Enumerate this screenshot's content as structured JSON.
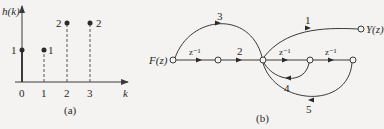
{
  "figure_a": {
    "y_label": "h(k)",
    "x_label": "k",
    "caption": "(a)",
    "ticks": [
      "0",
      "1",
      "2",
      "3"
    ],
    "points": [
      {
        "k": "0",
        "value": "1",
        "label_side": "left"
      },
      {
        "k": "1",
        "value": "1",
        "label_side": "right"
      },
      {
        "k": "2",
        "value": "2",
        "label_side": "left"
      },
      {
        "k": "3",
        "value": "2",
        "label_side": "right"
      }
    ]
  },
  "figure_b": {
    "caption": "(b)",
    "input": "F(z)",
    "output": "Y(z)",
    "branches": {
      "forward_delay_1": "z⁻¹",
      "gain_2": "2",
      "feedforward_3": "3",
      "output_gain_1": "1",
      "delay_2": "z⁻¹",
      "delay_3": "z⁻¹",
      "feedback_4": "4",
      "feedback_5": "5"
    }
  },
  "colors": {
    "line": "#3a3a3a",
    "background": "#f4f3f1"
  }
}
